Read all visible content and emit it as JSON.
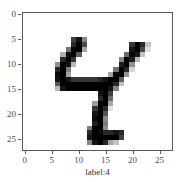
{
  "figure": {
    "background_color": "#ffffff",
    "axes_edge_color": "#595959",
    "tick_color": "#4d4d4d"
  },
  "chart_data": {
    "type": "heatmap",
    "title": "",
    "subtitle": "",
    "xlabel": "label:4",
    "ylabel": "",
    "colormap": "gray_r",
    "grid": false,
    "legend": null,
    "xlim": [
      -0.5,
      27.5
    ],
    "ylim": [
      27.5,
      -0.5
    ],
    "xticks": [
      0,
      5,
      10,
      15,
      20,
      25
    ],
    "xticklabels": [
      "0",
      "5",
      "10",
      "15",
      "20",
      "25"
    ],
    "yticks": [
      0,
      5,
      10,
      15,
      20,
      25
    ],
    "yticklabels": [
      "0",
      "5",
      "10",
      "15",
      "20",
      "25"
    ],
    "shape": [
      28,
      28
    ],
    "value_range": [
      0,
      255
    ],
    "annotations": [
      "label:4"
    ],
    "pixels": [
      [
        0,
        0,
        0,
        0,
        0,
        0,
        0,
        0,
        0,
        0,
        0,
        0,
        0,
        0,
        0,
        0,
        0,
        0,
        0,
        0,
        0,
        0,
        0,
        0,
        0,
        0,
        0,
        0
      ],
      [
        0,
        0,
        0,
        0,
        0,
        0,
        0,
        0,
        0,
        0,
        0,
        0,
        0,
        0,
        0,
        0,
        0,
        0,
        0,
        0,
        0,
        0,
        0,
        0,
        0,
        0,
        0,
        0
      ],
      [
        0,
        0,
        0,
        0,
        0,
        0,
        0,
        0,
        0,
        0,
        0,
        0,
        0,
        0,
        0,
        0,
        0,
        0,
        0,
        0,
        0,
        0,
        0,
        0,
        0,
        0,
        0,
        0
      ],
      [
        0,
        0,
        0,
        0,
        0,
        0,
        0,
        0,
        0,
        0,
        0,
        0,
        0,
        0,
        0,
        0,
        0,
        0,
        0,
        0,
        0,
        0,
        0,
        0,
        0,
        0,
        0,
        0
      ],
      [
        0,
        0,
        0,
        0,
        0,
        0,
        0,
        0,
        0,
        0,
        0,
        0,
        0,
        0,
        0,
        0,
        0,
        0,
        0,
        0,
        0,
        0,
        0,
        0,
        0,
        0,
        0,
        0
      ],
      [
        0,
        0,
        0,
        0,
        0,
        0,
        0,
        0,
        0,
        190,
        235,
        120,
        0,
        0,
        0,
        0,
        0,
        0,
        0,
        0,
        0,
        0,
        0,
        0,
        0,
        0,
        0,
        0
      ],
      [
        0,
        0,
        0,
        0,
        0,
        0,
        0,
        0,
        0,
        215,
        255,
        180,
        0,
        0,
        0,
        0,
        0,
        0,
        0,
        0,
        200,
        250,
        215,
        60,
        0,
        0,
        0,
        0
      ],
      [
        0,
        0,
        0,
        0,
        0,
        0,
        0,
        0,
        140,
        250,
        255,
        90,
        0,
        0,
        0,
        0,
        0,
        0,
        0,
        0,
        235,
        255,
        180,
        30,
        0,
        0,
        0,
        0
      ],
      [
        0,
        0,
        0,
        0,
        0,
        0,
        0,
        80,
        240,
        255,
        160,
        0,
        0,
        0,
        0,
        0,
        0,
        0,
        0,
        150,
        255,
        230,
        60,
        0,
        0,
        0,
        0,
        0
      ],
      [
        0,
        0,
        0,
        0,
        0,
        0,
        0,
        215,
        255,
        200,
        0,
        0,
        0,
        0,
        0,
        0,
        0,
        0,
        120,
        255,
        225,
        70,
        0,
        0,
        0,
        0,
        0,
        0
      ],
      [
        0,
        0,
        0,
        0,
        0,
        0,
        110,
        255,
        235,
        70,
        0,
        0,
        0,
        0,
        0,
        0,
        0,
        0,
        225,
        255,
        110,
        0,
        0,
        0,
        0,
        0,
        0,
        0
      ],
      [
        0,
        0,
        0,
        0,
        0,
        0,
        215,
        255,
        130,
        0,
        0,
        0,
        0,
        0,
        0,
        0,
        0,
        140,
        255,
        215,
        40,
        0,
        0,
        0,
        0,
        0,
        0,
        0
      ],
      [
        0,
        0,
        0,
        0,
        0,
        0,
        245,
        255,
        90,
        0,
        0,
        0,
        0,
        0,
        0,
        0,
        90,
        245,
        255,
        110,
        0,
        0,
        0,
        0,
        0,
        0,
        0,
        0
      ],
      [
        0,
        0,
        0,
        0,
        0,
        0,
        235,
        255,
        235,
        200,
        200,
        200,
        200,
        200,
        215,
        235,
        255,
        255,
        160,
        0,
        0,
        0,
        0,
        0,
        0,
        0,
        0,
        0
      ],
      [
        0,
        0,
        0,
        0,
        0,
        0,
        170,
        255,
        255,
        255,
        255,
        255,
        255,
        255,
        255,
        255,
        255,
        215,
        60,
        0,
        0,
        0,
        0,
        0,
        0,
        0,
        0,
        0
      ],
      [
        0,
        0,
        0,
        0,
        0,
        0,
        70,
        235,
        255,
        255,
        255,
        255,
        255,
        255,
        255,
        255,
        235,
        120,
        0,
        0,
        0,
        0,
        0,
        0,
        0,
        0,
        0,
        0
      ],
      [
        0,
        0,
        0,
        0,
        0,
        0,
        0,
        0,
        0,
        0,
        0,
        0,
        0,
        0,
        235,
        255,
        190,
        0,
        0,
        0,
        0,
        0,
        0,
        0,
        0,
        0,
        0,
        0
      ],
      [
        0,
        0,
        0,
        0,
        0,
        0,
        0,
        0,
        0,
        0,
        0,
        0,
        0,
        0,
        215,
        255,
        150,
        0,
        0,
        0,
        0,
        0,
        0,
        0,
        0,
        0,
        0,
        0
      ],
      [
        0,
        0,
        0,
        0,
        0,
        0,
        0,
        0,
        0,
        0,
        0,
        0,
        0,
        100,
        250,
        255,
        90,
        0,
        0,
        0,
        0,
        0,
        0,
        0,
        0,
        0,
        0,
        0
      ],
      [
        0,
        0,
        0,
        0,
        0,
        0,
        0,
        0,
        0,
        0,
        0,
        0,
        0,
        200,
        255,
        215,
        30,
        0,
        0,
        0,
        0,
        0,
        0,
        0,
        0,
        0,
        0,
        0
      ],
      [
        0,
        0,
        0,
        0,
        0,
        0,
        0,
        0,
        0,
        0,
        0,
        0,
        0,
        235,
        255,
        170,
        0,
        0,
        0,
        0,
        0,
        0,
        0,
        0,
        0,
        0,
        0,
        0
      ],
      [
        0,
        0,
        0,
        0,
        0,
        0,
        0,
        0,
        0,
        0,
        0,
        0,
        0,
        245,
        255,
        120,
        0,
        0,
        0,
        0,
        0,
        0,
        0,
        0,
        0,
        0,
        0,
        0
      ],
      [
        0,
        0,
        0,
        0,
        0,
        0,
        0,
        0,
        0,
        0,
        0,
        0,
        0,
        225,
        255,
        130,
        0,
        0,
        0,
        0,
        0,
        0,
        0,
        0,
        0,
        0,
        0,
        0
      ],
      [
        0,
        0,
        0,
        0,
        0,
        0,
        0,
        0,
        0,
        0,
        0,
        0,
        130,
        255,
        255,
        110,
        0,
        0,
        0,
        0,
        0,
        0,
        0,
        0,
        0,
        0,
        0,
        0
      ],
      [
        0,
        0,
        0,
        0,
        0,
        0,
        0,
        0,
        0,
        0,
        0,
        0,
        215,
        255,
        245,
        215,
        215,
        235,
        215,
        0,
        0,
        0,
        0,
        0,
        0,
        0,
        0,
        0
      ],
      [
        0,
        0,
        0,
        0,
        0,
        0,
        0,
        0,
        0,
        0,
        0,
        0,
        235,
        255,
        255,
        255,
        255,
        255,
        190,
        0,
        0,
        0,
        0,
        0,
        0,
        0,
        0,
        0
      ],
      [
        0,
        0,
        0,
        0,
        0,
        0,
        0,
        0,
        0,
        0,
        0,
        0,
        120,
        235,
        255,
        215,
        90,
        60,
        0,
        0,
        0,
        0,
        0,
        0,
        0,
        0,
        0,
        0
      ],
      [
        0,
        0,
        0,
        0,
        0,
        0,
        0,
        0,
        0,
        0,
        0,
        0,
        0,
        0,
        0,
        0,
        0,
        0,
        0,
        0,
        0,
        0,
        0,
        0,
        0,
        0,
        0,
        0
      ]
    ]
  }
}
